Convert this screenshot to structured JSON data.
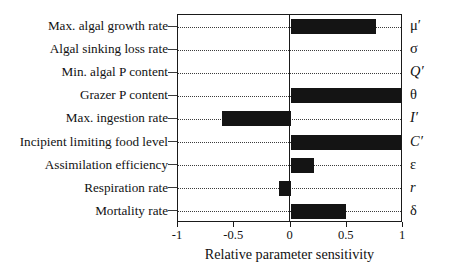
{
  "chart_data": {
    "type": "bar",
    "orientation": "horizontal",
    "title": "",
    "xlabel": "Relative parameter sensitivity",
    "ylabel": "",
    "xlim": [
      -1,
      1
    ],
    "xticks": [
      -1,
      -0.5,
      0,
      0.5,
      1
    ],
    "xticklabels": [
      "-1",
      "-0.5",
      "0",
      "0.5",
      "1"
    ],
    "grid": true,
    "grid_axis": "y",
    "grid_style": "dotted",
    "legend": false,
    "bar_color": "#141414",
    "categories": [
      "Max. algal growth rate",
      "Algal sinking loss rate",
      "Min. algal P content",
      "Grazer P content",
      "Max. ingestion rate",
      "Incipient limiting food level",
      "Assimilation efficiency",
      "Respiration rate",
      "Mortality rate"
    ],
    "symbols": [
      "μ′",
      "σ",
      "Q′",
      "θ",
      "I′",
      "C′",
      "ε",
      "r",
      "δ"
    ],
    "symbol_italic": [
      false,
      false,
      true,
      false,
      true,
      true,
      false,
      true,
      false
    ],
    "values": [
      0.76,
      0.0,
      0.0,
      0.98,
      -0.61,
      0.98,
      0.21,
      -0.1,
      0.49
    ]
  }
}
